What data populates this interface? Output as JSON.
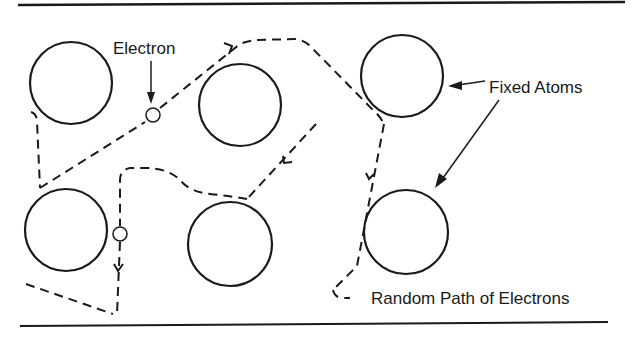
{
  "diagram": {
    "labels": {
      "electron": "Electron",
      "fixed_atoms": "Fixed Atoms",
      "random_path": "Random Path of Electrons"
    },
    "colors": {
      "ink": "#1a1a1a",
      "background": "#ffffff"
    },
    "atoms": [
      {
        "cx": 71,
        "cy": 83,
        "r": 41
      },
      {
        "cx": 240,
        "cy": 105,
        "r": 41
      },
      {
        "cx": 402,
        "cy": 76,
        "r": 41
      },
      {
        "cx": 66,
        "cy": 230,
        "r": 41
      },
      {
        "cx": 230,
        "cy": 244,
        "r": 42
      },
      {
        "cx": 406,
        "cy": 232,
        "r": 42
      }
    ],
    "electrons": [
      {
        "cx": 153,
        "cy": 115,
        "r": 7
      },
      {
        "cx": 120,
        "cy": 234,
        "r": 7
      }
    ]
  }
}
